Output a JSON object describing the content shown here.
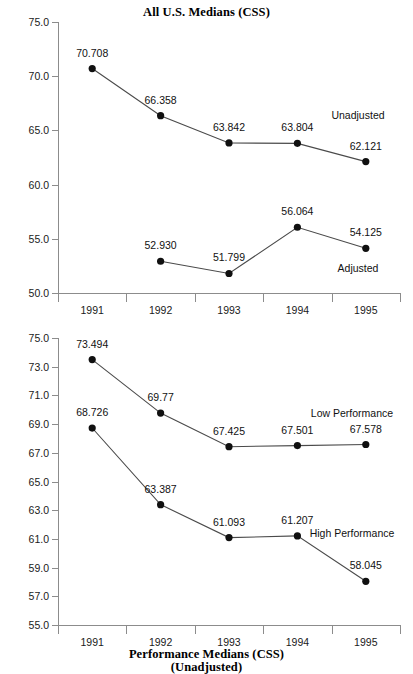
{
  "chart_data": [
    {
      "id": "all-us-medians",
      "type": "line",
      "title": "All U.S. Medians (CSS)",
      "title_line2": "",
      "xlabel": "",
      "ylabel": "",
      "categories": [
        "1991",
        "1992",
        "1993",
        "1994",
        "1995"
      ],
      "ylim": [
        50.0,
        75.0
      ],
      "ytick_step": 5.0,
      "yticks": [
        "75.0",
        "70.0",
        "65.0",
        "60.0",
        "55.0",
        "50.0"
      ],
      "grid": false,
      "legend_position": "inline-annotation",
      "series": [
        {
          "name": "Unadjusted",
          "values": [
            70.708,
            66.358,
            63.842,
            63.804,
            62.121
          ],
          "labels": [
            "70.708",
            "66.358",
            "63.842",
            "63.804",
            "62.121"
          ],
          "annotation": "Unadjusted"
        },
        {
          "name": "Adjusted",
          "values": [
            null,
            52.93,
            51.799,
            56.064,
            54.125
          ],
          "labels": [
            "",
            "52.930",
            "51.799",
            "56.064",
            "54.125"
          ],
          "annotation": "Adjusted"
        }
      ]
    },
    {
      "id": "performance-medians",
      "type": "line",
      "title": "Performance Medians (CSS)",
      "title_line2": "(Unadjusted)",
      "xlabel": "",
      "ylabel": "",
      "categories": [
        "1991",
        "1992",
        "1993",
        "1994",
        "1995"
      ],
      "ylim": [
        55.0,
        75.0
      ],
      "ytick_step": 2.0,
      "yticks": [
        "75.0",
        "73.0",
        "71.0",
        "69.0",
        "67.0",
        "65.0",
        "63.0",
        "61.0",
        "59.0",
        "57.0",
        "55.0"
      ],
      "grid": false,
      "legend_position": "inline-annotation",
      "series": [
        {
          "name": "Low Performance",
          "values": [
            73.494,
            69.77,
            67.425,
            67.501,
            67.578
          ],
          "labels": [
            "73.494",
            "69.77",
            "67.425",
            "67.501",
            "67.578"
          ],
          "annotation": "Low Performance"
        },
        {
          "name": "High Performance",
          "values": [
            68.726,
            63.387,
            61.093,
            61.207,
            58.045
          ],
          "labels": [
            "68.726",
            "63.387",
            "61.093",
            "61.207",
            "58.045"
          ],
          "annotation": "High Performance"
        }
      ]
    }
  ],
  "colors": {
    "background": "#ffffff",
    "axis": "#8c8c8c",
    "line": "#4a4a4a",
    "marker": "#101010",
    "text": "#111111"
  }
}
